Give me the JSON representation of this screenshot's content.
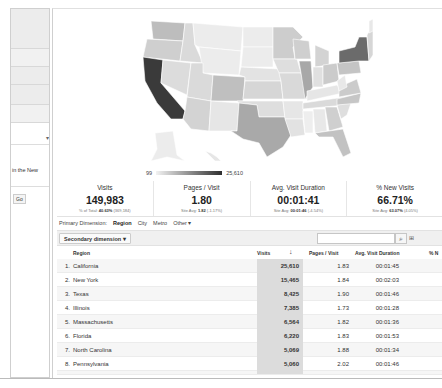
{
  "sidebar": {
    "text_fragment": "in the New",
    "go_button": "Go",
    "dropdown_arrow": "▾"
  },
  "map": {
    "title": "Visits by US State",
    "legend": {
      "min": "99",
      "max": "25,610"
    },
    "colors": {
      "darkest": "#3a3a3a",
      "dark": "#6b6b6b",
      "mid": "#a9a9a9",
      "light": "#c8c8c8",
      "lighter": "#dadada",
      "lightest": "#ececec",
      "border": "#ffffff"
    }
  },
  "metrics": [
    {
      "label": "Visits",
      "value": "149,983",
      "sub_prefix": "% of Total:",
      "sub_bold": "40.63%",
      "sub_suffix": "(369,184)"
    },
    {
      "label": "Pages / Visit",
      "value": "1.80",
      "sub_prefix": "Site Avg:",
      "sub_bold": "1.82",
      "sub_suffix": "(-1.17%)"
    },
    {
      "label": "Avg. Visit Duration",
      "value": "00:01:41",
      "sub_prefix": "Site Avg:",
      "sub_bold": "00:01:46",
      "sub_suffix": "(-4.54%)"
    },
    {
      "label": "% New Visits",
      "value": "66.71%",
      "sub_prefix": "Site Avg:",
      "sub_bold": "63.07%",
      "sub_suffix": "(4.05%)"
    }
  ],
  "primary_dimension": {
    "label": "Primary Dimension:",
    "options": [
      "Region",
      "City",
      "Metro",
      "Other ▾"
    ],
    "active": "Region"
  },
  "toolbar": {
    "secondary_dimension": "Secondary dimension ▾",
    "search_placeholder": "",
    "search_icon": "🔍",
    "extra": "⊞"
  },
  "table": {
    "headers": {
      "region": "Region",
      "visits": "Visits",
      "sort": "↓",
      "pages_per_visit": "Pages / Visit",
      "avg_duration": "Avg. Visit Duration",
      "new_visits": "% N"
    },
    "rows": [
      {
        "idx": "1.",
        "region": "California",
        "visits": "25,610",
        "ppv": "1.83",
        "duration": "00:01:45"
      },
      {
        "idx": "2.",
        "region": "New York",
        "visits": "15,465",
        "ppv": "1.84",
        "duration": "00:02:03"
      },
      {
        "idx": "3.",
        "region": "Texas",
        "visits": "8,425",
        "ppv": "1.90",
        "duration": "00:01:46"
      },
      {
        "idx": "4.",
        "region": "Illinois",
        "visits": "7,385",
        "ppv": "1.73",
        "duration": "00:01:28"
      },
      {
        "idx": "5.",
        "region": "Massachusetts",
        "visits": "6,564",
        "ppv": "1.82",
        "duration": "00:01:36"
      },
      {
        "idx": "6.",
        "region": "Florida",
        "visits": "6,220",
        "ppv": "1.83",
        "duration": "00:01:53"
      },
      {
        "idx": "7.",
        "region": "North Carolina",
        "visits": "5,069",
        "ppv": "1.88",
        "duration": "00:01:34"
      },
      {
        "idx": "8.",
        "region": "Pennsylvania",
        "visits": "5,060",
        "ppv": "2.02",
        "duration": "00:01:46"
      }
    ]
  }
}
